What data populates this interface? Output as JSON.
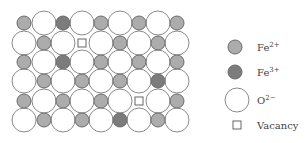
{
  "colors": {
    "fe2": "#acacac",
    "fe3": "#7c7c7c",
    "o2": "#ffffff",
    "ion_stroke": "#6a6a6a",
    "oxygen_stroke": "#8a8a8a",
    "vacancy_stroke": "#666666"
  },
  "lattice": {
    "columns_x": [
      24,
      44,
      63,
      82,
      101,
      120,
      139,
      158,
      177
    ],
    "rows": [
      {
        "y": 23,
        "sites": [
          "Fe2+",
          "O2-",
          "Fe3+",
          "O2-",
          "Fe2+",
          "O2-",
          "Fe2+",
          "O2-",
          "Fe2+"
        ]
      },
      {
        "y": 43,
        "sites": [
          "O2-",
          "Fe2+",
          "O2-",
          "Vacancy",
          "O2-",
          "Fe2+",
          "O2-",
          "Fe2+",
          "O2-"
        ]
      },
      {
        "y": 62,
        "sites": [
          "Fe2+",
          "O2-",
          "Fe3+",
          "O2-",
          "Fe2+",
          "O2-",
          "Fe2+",
          "O2-",
          "Fe2+"
        ]
      },
      {
        "y": 81,
        "sites": [
          "O2-",
          "Fe2+",
          "O2-",
          "Fe2+",
          "O2-",
          "Fe2+",
          "O2-",
          "Fe3+",
          "O2-"
        ]
      },
      {
        "y": 101,
        "sites": [
          "Fe2+",
          "O2-",
          "Fe2+",
          "O2-",
          "Fe2+",
          "O2-",
          "Vacancy",
          "O2-",
          "Fe2+"
        ]
      },
      {
        "y": 120,
        "sites": [
          "O2-",
          "Fe2+",
          "O2-",
          "Fe2+",
          "O2-",
          "Fe3+",
          "O2-",
          "Fe2+",
          "O2-"
        ]
      }
    ],
    "oxygen_radius": 12,
    "cation_radius": 7,
    "vacancy_size": 8
  },
  "legend": {
    "items": [
      {
        "key": "Fe2+",
        "symbol": "Fe",
        "charge": "2+",
        "cx": 235,
        "cy": 47
      },
      {
        "key": "Fe3+",
        "symbol": "Fe",
        "charge": "3+",
        "cx": 235,
        "cy": 72
      },
      {
        "key": "O2-",
        "symbol": "O",
        "charge": "2−",
        "cx": 237,
        "cy": 100
      },
      {
        "key": "Vacancy",
        "label": "Vacancy",
        "cx": 237,
        "cy": 125
      }
    ],
    "text_x": 257
  }
}
